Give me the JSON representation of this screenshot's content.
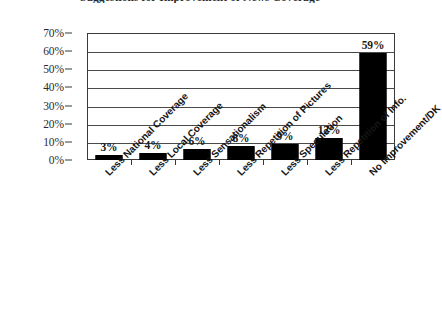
{
  "chart_data": {
    "type": "bar",
    "title": "Suggestions for Improvement of News Coverage",
    "xlabel": "",
    "ylabel": "",
    "ylim": [
      0,
      70
    ],
    "ytick_labels": [
      "70%",
      "60%",
      "50%",
      "40%",
      "30%",
      "20%",
      "10%",
      "0%"
    ],
    "ytick_values": [
      70,
      60,
      50,
      40,
      30,
      20,
      10,
      0
    ],
    "grid": true,
    "legend": "none",
    "categories": [
      "Less National Coverage",
      "Less Local Coverage",
      "Less Sensationalism",
      "Less Repetition of Pictures",
      "Less Speculation",
      "Less Repetition of Info.",
      "No Improvement/DK"
    ],
    "values": [
      3,
      4,
      6,
      8,
      9,
      12,
      59
    ],
    "value_labels": [
      "3%",
      "4%",
      "6%",
      "8%",
      "9%",
      "12%",
      "59%"
    ],
    "bar_color": "#000000",
    "axis_color": "#3a3a3a",
    "background_color": "#ffffff"
  }
}
